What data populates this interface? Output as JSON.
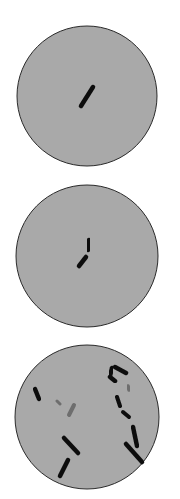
{
  "figure": {
    "background": "#ffffff",
    "dish_fill": "#a9a9a9",
    "dish_stroke": "#2a2a2a",
    "cell_color": "#111111",
    "faint_cell_color": "#6e6e6e",
    "panels": [
      {
        "id": "panel-1",
        "label": "single rod cell",
        "cx": 87,
        "cy": 96,
        "r": 70,
        "cells": [
          {
            "x1": 81,
            "y1": 106,
            "x2": 93,
            "y2": 87,
            "w": 4.5,
            "faint": false
          }
        ]
      },
      {
        "id": "panel-2",
        "label": "dividing rod cell",
        "cx": 87,
        "cy": 256,
        "r": 71,
        "cells": [
          {
            "x1": 89,
            "y1": 240,
            "x2": 88,
            "y2": 250,
            "w": 4.5,
            "faint": false
          },
          {
            "x1": 86,
            "y1": 257,
            "x2": 79,
            "y2": 266,
            "w": 4.5,
            "faint": false
          }
        ]
      },
      {
        "id": "panel-3",
        "label": "multiple rod cells",
        "cx": 87,
        "cy": 417,
        "r": 72,
        "cells": [
          {
            "x1": 35,
            "y1": 389,
            "x2": 39,
            "y2": 399,
            "w": 4.5,
            "faint": false
          },
          {
            "x1": 57,
            "y1": 401,
            "x2": 60,
            "y2": 404,
            "w": 3,
            "faint": true
          },
          {
            "x1": 74,
            "y1": 405,
            "x2": 69,
            "y2": 415,
            "w": 4,
            "faint": true
          },
          {
            "x1": 64,
            "y1": 438,
            "x2": 78,
            "y2": 453,
            "w": 4.5,
            "faint": false
          },
          {
            "x1": 68,
            "y1": 460,
            "x2": 60,
            "y2": 476,
            "w": 4.5,
            "faint": false
          },
          {
            "x1": 115,
            "y1": 367,
            "x2": 126,
            "y2": 373,
            "w": 4.5,
            "faint": false
          },
          {
            "x1": 112,
            "y1": 368,
            "x2": 110,
            "y2": 376,
            "w": 4.5,
            "faint": false
          },
          {
            "x1": 110,
            "y1": 377,
            "x2": 115,
            "y2": 381,
            "w": 4.5,
            "faint": false
          },
          {
            "x1": 128,
            "y1": 386,
            "x2": 129,
            "y2": 390,
            "w": 3.5,
            "faint": true
          },
          {
            "x1": 117,
            "y1": 397,
            "x2": 120,
            "y2": 406,
            "w": 4,
            "faint": false
          },
          {
            "x1": 123,
            "y1": 412,
            "x2": 129,
            "y2": 417,
            "w": 4,
            "faint": false
          },
          {
            "x1": 133,
            "y1": 427,
            "x2": 137,
            "y2": 446,
            "w": 4.5,
            "faint": false
          },
          {
            "x1": 126,
            "y1": 444,
            "x2": 142,
            "y2": 462,
            "w": 4.5,
            "faint": false
          }
        ]
      }
    ]
  }
}
